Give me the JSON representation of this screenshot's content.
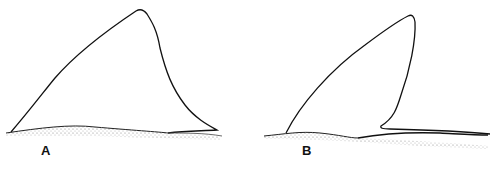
{
  "figure": {
    "panels": [
      {
        "id": "A",
        "label": "A",
        "description": "Triangular dorsal fin outline on stippled body surface"
      },
      {
        "id": "B",
        "label": "B",
        "description": "Falcate (hooked) dorsal fin outline with long trailing free rear tip on stippled body surface"
      }
    ],
    "colors": {
      "line": "#111111",
      "stipple": "#9a9a9a",
      "background": "#ffffff"
    }
  }
}
